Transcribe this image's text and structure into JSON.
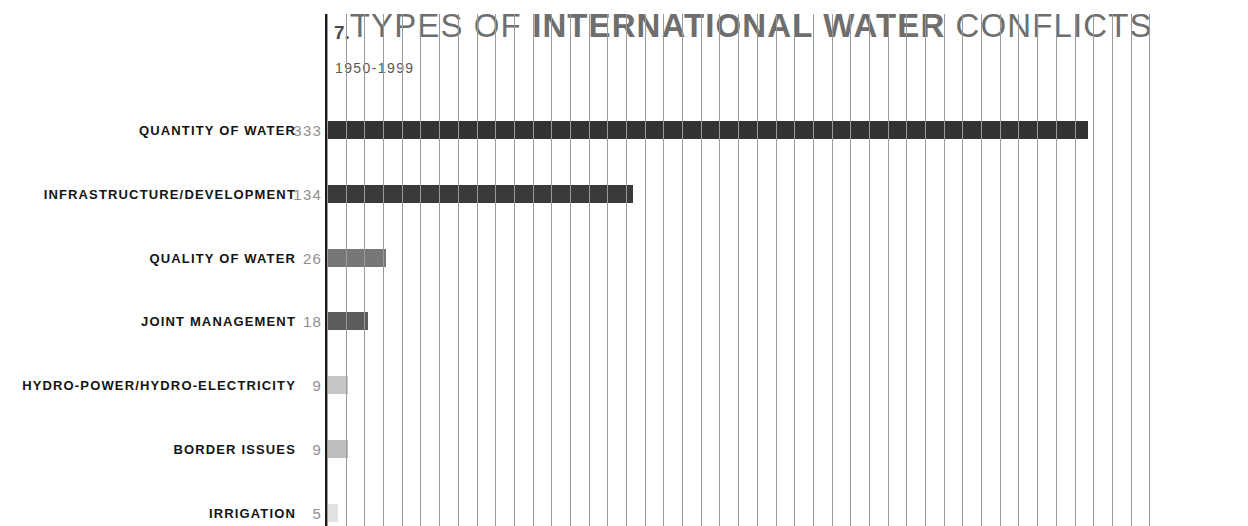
{
  "header": {
    "number": "7.",
    "title_part_light_1": "TYPES OF ",
    "title_part_bold": "INTERNATIONAL WATER",
    "title_part_light_2": " CONFLICTS",
    "subtitle": "1950-1999"
  },
  "chart_data": {
    "type": "bar",
    "orientation": "horizontal",
    "subtitle": "1950-1999",
    "xlabel": "",
    "ylabel": "",
    "grid": "vertical",
    "legend": "none",
    "xlim": [
      0,
      368
    ],
    "categories": [
      "QUANTITY OF WATER",
      "INFRASTRUCTURE/DEVELOPMENT",
      "QUALITY OF WATER",
      "JOINT MANAGEMENT",
      "HYDRO-POWER/HYDRO-ELECTRICITY",
      "BORDER ISSUES",
      "IRRIGATION"
    ],
    "values": [
      333,
      134,
      26,
      18,
      9,
      9,
      5
    ],
    "value_labels": [
      "333",
      "134",
      "26",
      "18",
      "9",
      "9",
      "5"
    ],
    "bar_colors": [
      "#333333",
      "#3a3a3a",
      "#77777a",
      "#5c5c5e",
      "#c6c6c8",
      "#bdbdbf",
      "#e2e2e4"
    ],
    "colors": {
      "axis": "#1a1a1a",
      "gridline": "#9a9a9a",
      "label": "#141414",
      "value": "#8f8f8f",
      "title": "#6e6e6e",
      "subtitle": "#58585a",
      "background": "#ffffff"
    }
  }
}
